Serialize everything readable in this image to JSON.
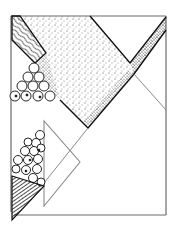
{
  "illustration": {
    "kind": "hand-drawn geometric sketch",
    "background": "#ffffff",
    "ink": "#1a1a1a",
    "gray_line": "#8a8a8a",
    "frame": {
      "x1": 11,
      "y1": 16,
      "x2": 166,
      "y2": 215
    },
    "shapes": [
      {
        "name": "hatched-parallelogram",
        "fill": "wavy-hatch"
      },
      {
        "name": "stippled-polygon",
        "fill": "stipple"
      },
      {
        "name": "stippled-band",
        "fill": "stipple"
      },
      {
        "name": "circle-triangle-top",
        "fill": "circles"
      },
      {
        "name": "gray-triangle",
        "fill": "none"
      },
      {
        "name": "circle-cluster-bottom",
        "fill": "circles"
      },
      {
        "name": "hatched-cone",
        "fill": "line-hatch"
      }
    ]
  }
}
